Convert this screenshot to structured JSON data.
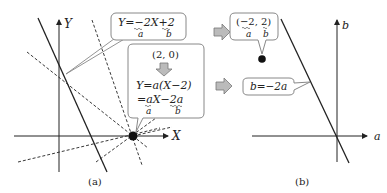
{
  "panel_a": {
    "caption": "(a)",
    "axis_x_label": "X",
    "axis_y_label": "Y",
    "callout_line": {
      "equation": "Y=−2X+2",
      "slope_label": "a",
      "intercept_label": "b"
    },
    "callout_point": {
      "point": "(2, 0)",
      "line1": "Y=a(X−2)",
      "line2": "=aX−2a",
      "slope_label": "a",
      "intercept_label": "b"
    },
    "point_marker": "(2, 0)"
  },
  "panel_b": {
    "caption": "(b)",
    "axis_x_label": "a",
    "axis_y_label": "b",
    "callout_point": {
      "point": "(−2, 2)",
      "slope_label": "a",
      "intercept_label": "b"
    },
    "callout_line": {
      "equation": "b=−2a"
    }
  },
  "colors": {
    "line": "#222222",
    "box_border": "#888888",
    "arrow_fill": "#bbbbbb",
    "arrow_stroke": "#777777"
  }
}
